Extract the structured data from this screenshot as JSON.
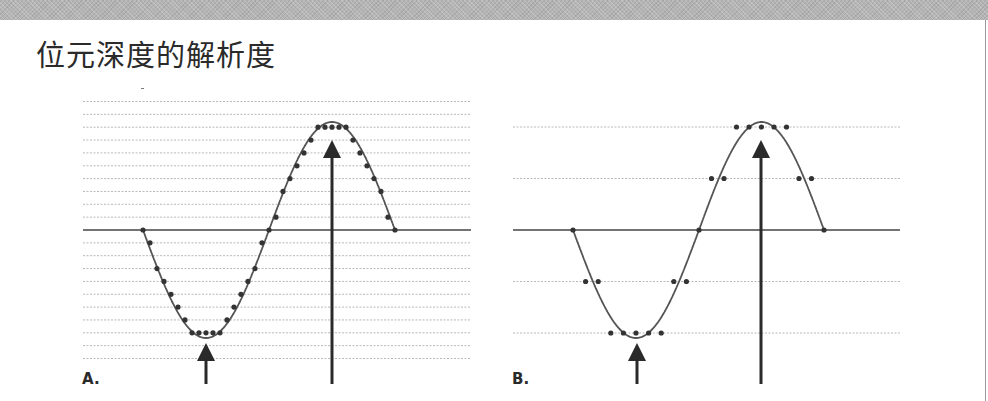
{
  "header": {
    "title": "位元深度的解析度"
  },
  "colors": {
    "band": "#b4b4b4",
    "text": "#2a2a2a",
    "curve": "#555555",
    "dot": "#333333",
    "grid": "#b8b8b8",
    "baseline": "#444444",
    "arrow": "#2a2a2a"
  },
  "panels": [
    {
      "id": "A",
      "label": "A.",
      "label_pos": [
        82,
        370
      ],
      "x_range": [
        83,
        471
      ],
      "baseline_y": 230,
      "grid_spacing": 12.85,
      "levels_above": 10,
      "levels_below": 10,
      "wave": {
        "x_start": 143,
        "x_mid": 269,
        "x_end": 395,
        "amplitude_px": 108
      },
      "dot_count_per_half": 19,
      "arrows": [
        {
          "x": 206,
          "tip_y": 343,
          "bottom_y": 384,
          "direction": "up",
          "role": "trough"
        },
        {
          "x": 332,
          "tip_y": 140,
          "bottom_y": 384,
          "direction": "up",
          "role": "peak"
        }
      ]
    },
    {
      "id": "B",
      "label": "B.",
      "label_pos": [
        512,
        370
      ],
      "x_range": [
        513,
        900
      ],
      "baseline_y": 230,
      "grid_spacing": 51.5,
      "levels_above": 2,
      "levels_below": 2,
      "wave": {
        "x_start": 573,
        "x_mid": 699,
        "x_end": 824,
        "amplitude_px": 108
      },
      "dot_count_per_half": 11,
      "arrows": [
        {
          "x": 637,
          "tip_y": 343,
          "bottom_y": 384,
          "direction": "up",
          "role": "trough"
        },
        {
          "x": 761,
          "tip_y": 140,
          "bottom_y": 384,
          "direction": "up",
          "role": "peak"
        }
      ]
    }
  ],
  "icons": {
    "arrow": "up-arrow-icon"
  }
}
